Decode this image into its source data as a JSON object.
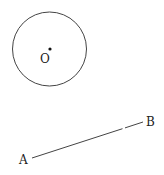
{
  "figure": {
    "circle": {
      "center_label": "O",
      "cx": 49.5,
      "cy": 49,
      "r": 37,
      "stroke": "#444444"
    },
    "center_point": {
      "x": 50,
      "y": 49
    },
    "segment": {
      "start_label": "A",
      "end_label": "B",
      "start": {
        "x": 32,
        "y": 158
      },
      "end": {
        "x": 143,
        "y": 122
      },
      "stroke": "#444444"
    }
  }
}
